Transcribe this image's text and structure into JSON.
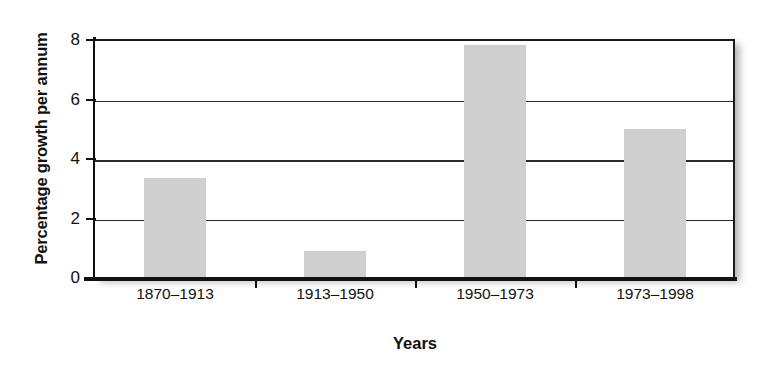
{
  "chart_data": {
    "type": "bar",
    "title": "",
    "xlabel": "Years",
    "ylabel": "Percentage growth per annum",
    "categories": [
      "1870–1913",
      "1913–1950",
      "1950–1973",
      "1973–1998"
    ],
    "values": [
      3.4,
      0.95,
      7.85,
      5.05
    ],
    "ylim": [
      0,
      8
    ],
    "yticks": [
      0,
      2,
      4,
      6,
      8
    ],
    "ytick_labels": [
      "0",
      "2",
      "4",
      "6",
      "8"
    ],
    "grid": "horizontal",
    "legend": "none",
    "series": [
      {
        "name": "Percentage growth per annum",
        "values": [
          3.4,
          0.95,
          7.85,
          5.05
        ],
        "color": "#cfcfcf"
      }
    ],
    "colors": {
      "bar_fill": "#cfcfcf",
      "axis": "#111111",
      "gridline": "#2b2b2b",
      "background": "#ffffff",
      "text": "#111111"
    }
  }
}
